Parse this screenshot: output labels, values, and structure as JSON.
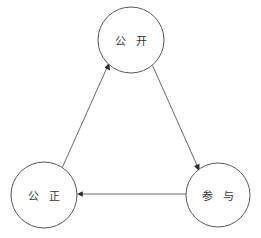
{
  "diagram": {
    "type": "cycle-diagram",
    "background_color": "#ffffff",
    "node_stroke_color": "#595959",
    "edge_color": "#6a6a6a",
    "label_color": "#333333",
    "nodes": [
      {
        "id": "gongkai",
        "label": "公 开",
        "cx": 131,
        "cy": 40,
        "r": 33
      },
      {
        "id": "gongzheng",
        "label": "公 正",
        "cx": 44,
        "cy": 195,
        "r": 33
      },
      {
        "id": "canyu",
        "label": "参 与",
        "cx": 218,
        "cy": 195,
        "r": 32
      }
    ],
    "edges": [
      {
        "from": "gongkai",
        "to": "canyu",
        "direction": "gongkai-to-canyu"
      },
      {
        "from": "canyu",
        "to": "gongzheng",
        "direction": "canyu-to-gongzheng"
      },
      {
        "from": "gongzheng",
        "to": "gongkai",
        "direction": "gongzheng-to-gongkai"
      }
    ]
  }
}
